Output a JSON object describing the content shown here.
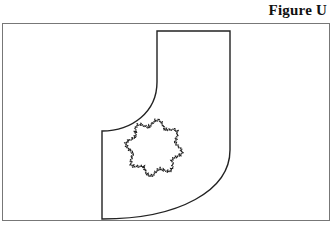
{
  "figure": {
    "title": "Figure U"
  },
  "diagram": {
    "shapes": [
      "j-shaped-region",
      "flower-curve"
    ],
    "stroke_color": "#222222",
    "frame_color": "#777777"
  }
}
